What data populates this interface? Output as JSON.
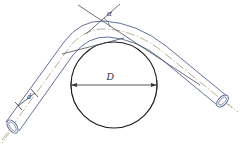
{
  "figure": {
    "background_color": "#ffffff",
    "width": 243,
    "height": 154
  },
  "labels": {
    "bend_angle": "α",
    "mandrel_diameter": "D",
    "pipe_diameter": "d"
  },
  "colors": {
    "pipe_outline": "#5b6a93",
    "pipe_centerline": "#9b8f6e",
    "mandrel_circle": "#1a1a1a",
    "dimension_line": "#3a3a3a",
    "angle_line": "#4a4a5e",
    "text": "#2b2b3a"
  },
  "geometry": {
    "mandrel_circle": {
      "cx": 114,
      "cy": 85,
      "r": 43
    },
    "diameter_dimension": {
      "x1": 71,
      "x2": 157,
      "y": 85
    },
    "angle_vertex": {
      "x": 95,
      "y": 14
    },
    "left_pipe_end": {
      "x": 20,
      "y": 132
    },
    "right_pipe_end": {
      "x": 220,
      "y": 100
    }
  },
  "annotations": {
    "pipe_diameter_tick_left": "tick",
    "pipe_diameter_tick_right": "tick",
    "diameter_arrow_left": "arrow",
    "diameter_arrow_right": "arrow"
  }
}
